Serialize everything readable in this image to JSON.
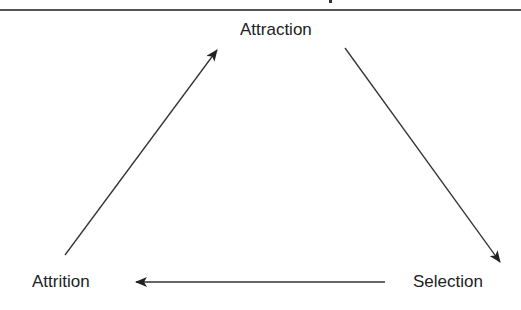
{
  "diagram": {
    "nodes": [
      {
        "id": "attraction",
        "label": "Attraction"
      },
      {
        "id": "selection",
        "label": "Selection"
      },
      {
        "id": "attrition",
        "label": "Attrition"
      }
    ],
    "edges": [
      {
        "from": "attraction",
        "to": "selection"
      },
      {
        "from": "selection",
        "to": "attrition"
      },
      {
        "from": "attrition",
        "to": "attraction"
      }
    ],
    "colors": {
      "line": "#333333",
      "text": "#222222",
      "rule": "#555555"
    }
  }
}
